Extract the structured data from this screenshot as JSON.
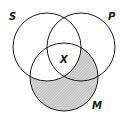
{
  "diagram": {
    "type": "venn-3",
    "circles": [
      {
        "id": "S",
        "label": "S",
        "cx": 47,
        "cy": 47,
        "r": 34
      },
      {
        "id": "P",
        "label": "P",
        "cx": 81,
        "cy": 47,
        "r": 34
      },
      {
        "id": "M",
        "label": "M",
        "cx": 64,
        "cy": 77,
        "r": 34
      }
    ],
    "labels": {
      "S": "S",
      "P": "P",
      "M": "M",
      "mark": "X"
    },
    "mark_region": "S ∩ P ∩ M",
    "shaded_region": "M − S",
    "colors": {
      "stroke": "#1a1a1a",
      "shade": "#c8c8c8",
      "background": "#ffffff"
    }
  }
}
